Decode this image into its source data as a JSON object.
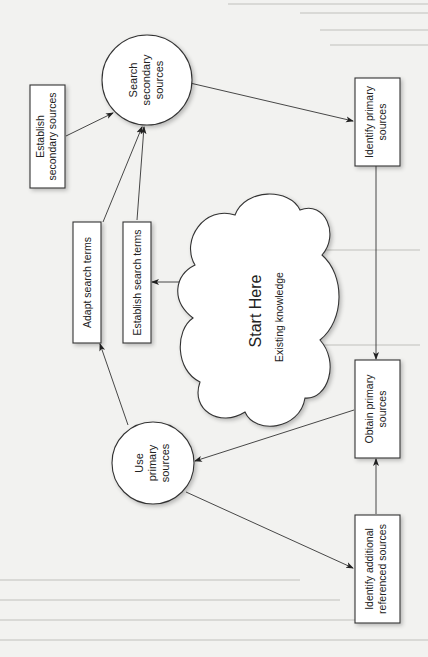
{
  "diagram": {
    "orientation": "rotated-90-ccw",
    "nodes": {
      "establish_secondary": {
        "line1": "Establish",
        "line2": "secondary sources",
        "shape": "rectangle"
      },
      "search_secondary": {
        "line1": "Search",
        "line2": "secondary",
        "line3": "sources",
        "shape": "circle"
      },
      "identify_primary": {
        "line1": "Identify primary",
        "line2": "sources",
        "shape": "rectangle"
      },
      "adapt_terms": {
        "line1": "Adapt search terms",
        "shape": "rectangle"
      },
      "establish_terms": {
        "line1": "Establish search terms",
        "shape": "rectangle"
      },
      "start_here": {
        "title": "Start Here",
        "subtitle": "Existing knowledge",
        "shape": "cloud"
      },
      "use_primary": {
        "line1": "Use",
        "line2": "primary",
        "line3": "sources",
        "shape": "circle"
      },
      "obtain_primary": {
        "line1": "Obtain primary",
        "line2": "sources",
        "shape": "rectangle"
      },
      "identify_additional": {
        "line1": "Identify additional",
        "line2": "referenced sources",
        "shape": "rectangle"
      }
    },
    "edges": [
      {
        "from": "start_here",
        "to": "establish_terms"
      },
      {
        "from": "establish_terms",
        "to": "search_secondary"
      },
      {
        "from": "adapt_terms",
        "to": "search_secondary"
      },
      {
        "from": "establish_secondary",
        "to": "search_secondary"
      },
      {
        "from": "search_secondary",
        "to": "identify_primary"
      },
      {
        "from": "identify_primary",
        "to": "obtain_primary"
      },
      {
        "from": "obtain_primary",
        "to": "use_primary"
      },
      {
        "from": "identify_additional",
        "to": "obtain_primary"
      },
      {
        "from": "use_primary",
        "to": "identify_additional"
      },
      {
        "from": "use_primary",
        "to": "adapt_terms"
      }
    ],
    "colors": {
      "stroke": "#333333",
      "fill": "#ffffff",
      "page": "#f2f2f0",
      "text": "#222222"
    }
  }
}
